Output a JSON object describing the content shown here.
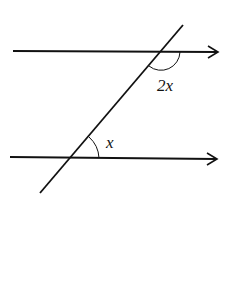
{
  "diagram": {
    "type": "parallel-lines-transversal",
    "colors": {
      "line": "#111111",
      "background": "#ffffff"
    },
    "lines": {
      "top": {
        "x1": 13,
        "y1": 51,
        "x2": 218,
        "y2": 52
      },
      "bottom": {
        "x1": 10,
        "y1": 157,
        "x2": 217,
        "y2": 159
      },
      "transversal": {
        "x1": 183,
        "y1": 25,
        "x2": 40,
        "y2": 193
      }
    },
    "angles": [
      {
        "label": "2x",
        "vertex": "top-intersection",
        "position": "below-right"
      },
      {
        "label": "x",
        "vertex": "bottom-intersection",
        "position": "above-right"
      }
    ]
  }
}
